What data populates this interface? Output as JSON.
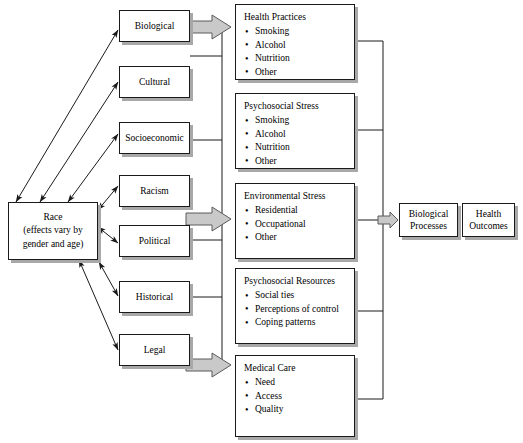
{
  "diagram": {
    "colors": {
      "box_fill": "#ffffff",
      "box_border": "#1a1a1a",
      "box_shadow": "#a8a8a8",
      "thick_arrow_fill": "#c9c9c9",
      "thick_arrow_stroke": "#5a5a5a",
      "connector_line": "#1a1a1a"
    }
  },
  "root": {
    "name": "race",
    "line1": "Race",
    "line2": "(effects vary by",
    "line3": "gender and age)"
  },
  "determinants": [
    {
      "id": "biological",
      "label": "Biological"
    },
    {
      "id": "cultural",
      "label": "Cultural"
    },
    {
      "id": "socioeconomic",
      "label": "Socioeconomic"
    },
    {
      "id": "racism",
      "label": "Racism"
    },
    {
      "id": "political",
      "label": "Political"
    },
    {
      "id": "historical",
      "label": "Historical"
    },
    {
      "id": "legal",
      "label": "Legal"
    }
  ],
  "mediators": [
    {
      "id": "health-practices",
      "title": "Health Practices",
      "items": [
        "Smoking",
        "Alcohol",
        "Nutrition",
        "Other"
      ]
    },
    {
      "id": "psychosocial-stress",
      "title": "Psychosocial Stress",
      "items": [
        "Smoking",
        "Alcohol",
        "Nutrition",
        "Other"
      ]
    },
    {
      "id": "environmental-stress",
      "title": "Environmental Stress",
      "items": [
        "Residential",
        "Occupational",
        "Other"
      ]
    },
    {
      "id": "psychosocial-resources",
      "title": "Psychosocial Resources",
      "items": [
        "Social ties",
        "Perceptions of control",
        "Coping patterns"
      ]
    },
    {
      "id": "medical-care",
      "title": "Medical Care",
      "items": [
        "Need",
        "Access",
        "Quality"
      ]
    }
  ],
  "outcomes": [
    {
      "id": "biological-processes",
      "line1": "Biological",
      "line2": "Processes"
    },
    {
      "id": "health-outcomes",
      "line1": "Health",
      "line2": "Outcomes"
    }
  ]
}
